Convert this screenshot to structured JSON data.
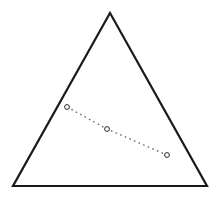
{
  "figure": {
    "name": "triangle-with-dotted-segment",
    "background_color": "#ffffff",
    "width": 218,
    "height": 200
  },
  "triangle": {
    "name": "triangle-outline",
    "stroke_color": "#1a1a1a",
    "stroke_width": 2.2,
    "fill": "none",
    "vertices": [
      {
        "label": "apex",
        "x": 110,
        "y": 13
      },
      {
        "label": "bottom-right",
        "x": 207,
        "y": 186
      },
      {
        "label": "bottom-left",
        "x": 13,
        "y": 186
      }
    ],
    "points_attr": "110,13 207,186 13,186"
  },
  "dotted_segment": {
    "name": "dotted-polyline",
    "stroke_color": "#6e6e6e",
    "stroke_width": 1.4,
    "dash_pattern": "1.6 3.4",
    "points_attr": "67,107 107,129 167,155"
  },
  "markers": [
    {
      "name": "marker-left",
      "cx": 67,
      "cy": 107,
      "r": 2.4,
      "stroke_color": "#2b2b2b",
      "fill": "#ffffff"
    },
    {
      "name": "marker-middle",
      "cx": 107,
      "cy": 129,
      "r": 2.4,
      "stroke_color": "#2b2b2b",
      "fill": "#ffffff"
    },
    {
      "name": "marker-right",
      "cx": 167,
      "cy": 155,
      "r": 2.4,
      "stroke_color": "#2b2b2b",
      "fill": "#ffffff"
    }
  ],
  "chart_data": {
    "type": "scatter",
    "title": "",
    "subtitle": "",
    "xlabel": "",
    "ylabel": "",
    "xlim": [
      0,
      218
    ],
    "ylim": [
      200,
      0
    ],
    "grid": false,
    "legend": null,
    "annotations": [],
    "tick_labels": {
      "x": [],
      "y": []
    },
    "series": [
      {
        "name": "triangle-boundary",
        "type": "line",
        "style": "solid",
        "color": "#1a1a1a",
        "closed": true,
        "x": [
          110,
          207,
          13
        ],
        "y": [
          13,
          186,
          186
        ]
      },
      {
        "name": "dotted-path",
        "type": "line",
        "style": "dotted",
        "color": "#6e6e6e",
        "closed": false,
        "marker": "open-circle",
        "x": [
          67,
          107,
          167
        ],
        "y": [
          107,
          129,
          155
        ]
      }
    ]
  }
}
